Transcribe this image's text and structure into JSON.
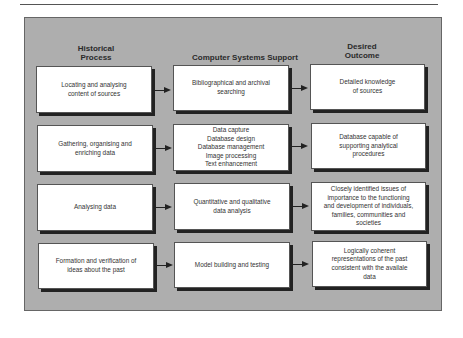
{
  "columns": {
    "historical": "Historical\nProcess",
    "computer": "Computer Systems Support",
    "outcome": "Desired\nOutcome"
  },
  "rows": [
    {
      "historical": "Locating and analysing\ncontent of sources",
      "computer": "Bibliographical and archival\nsearching",
      "outcome": "Detailed knowledge\nof sources"
    },
    {
      "historical": "Gathering, organising and\nenriching data",
      "computer": "Data capture\nDatabase design\nDatabase management\nImage processing\nText enhancement",
      "outcome": "Database capable of\nsupporting analytical\nprocedures"
    },
    {
      "historical": "Analysing data",
      "computer": "Quantitative and qualitative\ndata analysis",
      "outcome": "Closely identified issues of\nimportance to the functioning\nand development of individuals,\nfamilies, communities and\nsocieties"
    },
    {
      "historical": "Formation and verification of\nideas about the past",
      "computer": "Model building and testing",
      "outcome": "Logically coherent\nrepresentations of the past\nconsistent with the availale\ndata"
    }
  ],
  "colors": {
    "panel": "#aeaeae",
    "box": "#ffffff",
    "shadow": "#222222"
  }
}
